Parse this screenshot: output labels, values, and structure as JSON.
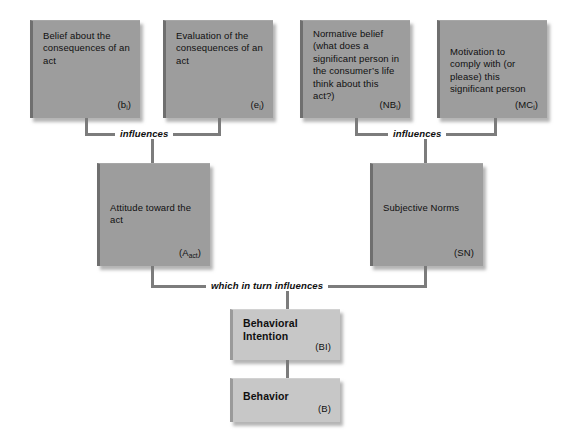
{
  "diagram": {
    "colors": {
      "box_fill": "#9d9d9d",
      "box_fill_light": "#c7c7c7",
      "connector": "#7c7c7c",
      "text": "#101010",
      "background": "#ffffff"
    },
    "boxes": [
      {
        "id": "belief-consequences",
        "text": "Belief about the consequences of an act",
        "tag": "(b",
        "tag_sub": "i",
        "tag_close": ")"
      },
      {
        "id": "evaluation-consequences",
        "text": "Evaluation of the consequences of an act",
        "tag": "(e",
        "tag_sub": "i",
        "tag_close": ")"
      },
      {
        "id": "normative-belief",
        "text": "Normative belief (what does a significant person in the consumer’s life think about this act?)",
        "tag": "(NB",
        "tag_sub": "i",
        "tag_close": ")"
      },
      {
        "id": "motivation-to-comply",
        "text": "Motivation to comply with (or please) this significant person",
        "tag": "(MC",
        "tag_sub": "i",
        "tag_close": ")"
      },
      {
        "id": "attitude-toward-act",
        "text": "Attitude toward the act",
        "tag": "(A",
        "tag_sub": "act",
        "tag_close": ")"
      },
      {
        "id": "subjective-norms",
        "text": "Subjective Norms",
        "tag": "(SN",
        "tag_sub": "",
        "tag_close": ")"
      },
      {
        "id": "behavioral-intention",
        "text": "Behavioral Intention",
        "tag": "(BI",
        "tag_sub": "",
        "tag_close": ")"
      },
      {
        "id": "behavior",
        "text": "Behavior",
        "tag": "(B",
        "tag_sub": "",
        "tag_close": ")"
      }
    ],
    "captions": {
      "influences_left": "influences",
      "influences_right": "influences",
      "which_in_turn": "which in turn influences"
    }
  }
}
